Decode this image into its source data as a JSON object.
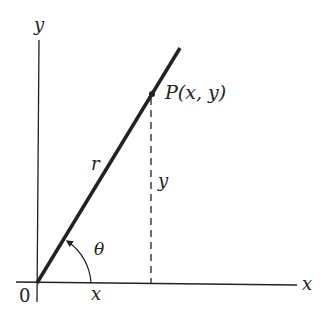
{
  "diagram": {
    "axes": {
      "x_label": "x",
      "y_label": "y",
      "origin_label": "0"
    },
    "point": {
      "label": "P(x, y)"
    },
    "segments": {
      "radius_label": "r",
      "vertical_label": "y",
      "horizontal_label": "x"
    },
    "angle": {
      "label": "θ"
    },
    "colors": {
      "ink": "#222222",
      "background": "#ffffff"
    }
  }
}
